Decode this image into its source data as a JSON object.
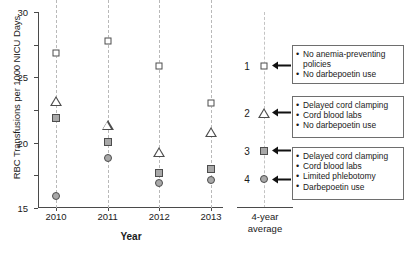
{
  "chart_data": {
    "type": "scatter",
    "title": "",
    "xlabel": "Year",
    "ylabel": "RBC Transfusions per 1000 NICU Days",
    "categories": [
      "2010",
      "2011",
      "2012",
      "2013"
    ],
    "ylim": [
      0,
      30
    ],
    "yticks": [
      0,
      5,
      10,
      15,
      20,
      25,
      30
    ],
    "grid": "vertical-dashed",
    "legend_position": "right-panel",
    "series": [
      {
        "name": "1",
        "marker": "open-square",
        "values": [
          23.7,
          25.5,
          21.8,
          16.0
        ]
      },
      {
        "name": "2",
        "marker": "open-triangle",
        "values": [
          16.4,
          14.3,
          11.6,
          16.3
        ]
      },
      {
        "name": "3",
        "marker": "filled-square",
        "values": [
          13.7,
          10.1,
          5.3,
          5.9
        ]
      },
      {
        "name": "4",
        "marker": "filled-circle",
        "values": [
          1.8,
          7.6,
          3.8,
          4.3
        ]
      }
    ],
    "average_panel": {
      "label_line1": "4-year",
      "label_line2": "average",
      "groups": [
        {
          "number": "1",
          "marker": "open-square",
          "y": 21.8,
          "bullets": [
            "No anemia-preventing policies",
            "No darbepoetin use"
          ]
        },
        {
          "number": "2",
          "marker": "open-triangle",
          "y": 14.6,
          "bullets": [
            "Delayed cord clamping",
            "Cord blood labs",
            "No darbepoetin use"
          ]
        },
        {
          "number": "3",
          "marker": "filled-square",
          "y": 8.8,
          "bullets": [
            "Delayed cord clamping",
            "Cord blood labs",
            "Limited phlebotomy",
            "Darbepoetin use"
          ]
        },
        {
          "number": "4",
          "marker": "filled-circle",
          "y": 4.4,
          "bullets": []
        }
      ]
    },
    "colors": {
      "axis": "#4a4a4a",
      "gridline": "#b9b9b9",
      "marker_edge": "#4d4d4d",
      "marker_fill": "#a8a8a8",
      "marker_open_fill": "#ffffff",
      "legend_border": "#6e6e6e"
    }
  }
}
